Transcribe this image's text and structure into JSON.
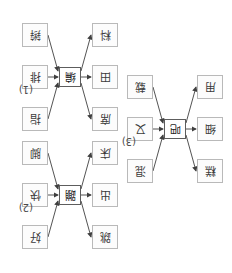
{
  "page": {
    "orientation": "rotated-180",
    "background_color": "#ffffff",
    "box_border_color": "#b9b9b9",
    "center_box_border_color": "#5d5d5d",
    "arrow_color": "#3f3f3f"
  },
  "diagrams": [
    {
      "id": "diagram-1",
      "label": "(1)",
      "center": "编",
      "incoming": [
        {
          "position": "top-right",
          "text": "指"
        },
        {
          "position": "middle-right",
          "text": "排"
        },
        {
          "position": "bottom-right",
          "text": "辫"
        }
      ],
      "outgoing": [
        {
          "position": "top-left",
          "text": "席"
        },
        {
          "position": "middle-left",
          "text": "田"
        },
        {
          "position": "bottom-left",
          "text": "料"
        }
      ]
    },
    {
      "id": "diagram-2",
      "label": "(2)",
      "center": "蹦",
      "incoming": [
        {
          "position": "top-right",
          "text": "好"
        },
        {
          "position": "middle-right",
          "text": "快"
        },
        {
          "position": "bottom-right",
          "text": "脚"
        }
      ],
      "outgoing": [
        {
          "position": "top-left",
          "text": "跳"
        },
        {
          "position": "middle-left",
          "text": "出"
        },
        {
          "position": "bottom-left",
          "text": "床"
        }
      ]
    },
    {
      "id": "diagram-3",
      "label": "(3)",
      "center": "吧",
      "incoming": [
        {
          "position": "top-right",
          "text": "混"
        },
        {
          "position": "middle-right",
          "text": "又"
        },
        {
          "position": "bottom-right",
          "text": "载"
        }
      ],
      "outgoing": [
        {
          "position": "top-left",
          "text": "糕"
        },
        {
          "position": "middle-left",
          "text": "细"
        },
        {
          "position": "bottom-left",
          "text": "用"
        }
      ]
    }
  ]
}
